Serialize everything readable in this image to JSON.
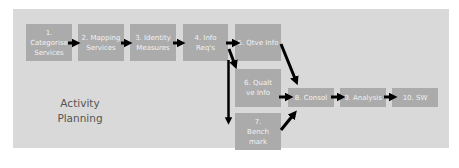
{
  "diagram": {
    "title": "Activity Planning",
    "colors": {
      "panel": "#d9d9d9",
      "box": "#ababab",
      "box_text": "#f2f2f2",
      "arrow": "#000000",
      "title_text": "#555555"
    },
    "nodes": [
      {
        "id": "1",
        "label": "1. Categorise Services"
      },
      {
        "id": "2",
        "label": "2. Mapping Services"
      },
      {
        "id": "3",
        "label": "3. Identity Measures"
      },
      {
        "id": "4",
        "label": "4. Info Req's"
      },
      {
        "id": "5",
        "label": "5. Qtve Info"
      },
      {
        "id": "6",
        "label": "6. Qualt ve Info"
      },
      {
        "id": "7",
        "label": "7. Bench mark"
      },
      {
        "id": "8",
        "label": "8. Consol"
      },
      {
        "id": "9",
        "label": "9. Analysis"
      },
      {
        "id": "10",
        "label": "10. SW"
      }
    ],
    "edges": [
      {
        "from": "1",
        "to": "2"
      },
      {
        "from": "2",
        "to": "3"
      },
      {
        "from": "3",
        "to": "4"
      },
      {
        "from": "4",
        "to": "5"
      },
      {
        "from": "4",
        "to": "6"
      },
      {
        "from": "4",
        "to": "7"
      },
      {
        "from": "5",
        "to": "8"
      },
      {
        "from": "6",
        "to": "8"
      },
      {
        "from": "7",
        "to": "8"
      },
      {
        "from": "8",
        "to": "9"
      },
      {
        "from": "9",
        "to": "10"
      }
    ]
  }
}
